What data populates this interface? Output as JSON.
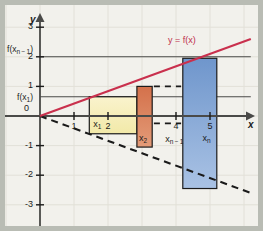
{
  "figure": {
    "background": "#f2f1ec",
    "frame_color": "#b9bcb4"
  },
  "axes": {
    "x_axis_label": "x",
    "y_axis_label": "y",
    "origin_label": "0",
    "x_ticks": [
      {
        "value": 1,
        "label": "1"
      },
      {
        "value": 2,
        "label": "2"
      },
      {
        "value": 4,
        "label": "4"
      },
      {
        "value": 5,
        "label": "5"
      }
    ],
    "y_ticks": [
      {
        "value": 3,
        "label": "3"
      },
      {
        "value": 2,
        "label": "2"
      },
      {
        "value": 1,
        "label": "1"
      },
      {
        "value": -1,
        "label": "-1"
      },
      {
        "value": -2,
        "label": "-2"
      },
      {
        "value": -3,
        "label": "-3"
      }
    ],
    "xlim": [
      -0.2,
      6.2
    ],
    "ylim": [
      -3.5,
      3.6
    ],
    "grid": true,
    "grid_color": "#e2e0d8",
    "axis_color": "#4a4a48"
  },
  "curve": {
    "label": "y = f(x)",
    "color": "#c9304d",
    "from": [
      0,
      0
    ],
    "to": [
      6.2,
      2.6
    ]
  },
  "dashed_line": {
    "color": "#1a1a1a",
    "style": "dashed",
    "from": [
      0,
      0
    ],
    "to": [
      6.2,
      -2.6
    ]
  },
  "value_labels": [
    {
      "name": "f-x-n-minus-1",
      "text": "f(x",
      "sub": "n − 1",
      "tail": ")",
      "y_value": 2.0
    },
    {
      "name": "f-x-1",
      "text": "f(x",
      "sub": "1",
      "tail": ")",
      "y_value": 0.65
    }
  ],
  "guide_lines": [
    {
      "name": "guide-f-xn-1",
      "y_value": 2.0,
      "from_x": 0,
      "to_x": 6.2
    },
    {
      "name": "guide-f-x1",
      "y_value": 0.65,
      "from_x": 0,
      "to_x": 6.2
    }
  ],
  "rectangles": [
    {
      "name": "rect-x1",
      "label": "x",
      "sub": "1",
      "x_start": 1.45,
      "x_end": 2.85,
      "y_top": 0.65,
      "y_bottom": -0.6,
      "fill_top": "#faf3cd",
      "fill_bottom": "#f2e9a8",
      "stroke": "#1b1b1b"
    },
    {
      "name": "rect-x2",
      "label": "x",
      "sub": "2",
      "x_start": 2.85,
      "x_end": 3.3,
      "y_top": 1.0,
      "y_bottom": -1.05,
      "fill_top": "#d4714b",
      "fill_bottom": "#e39b78",
      "stroke": "#1b1b1b"
    },
    {
      "name": "rect-xn",
      "label": "x",
      "sub": "n",
      "x_start": 4.2,
      "x_end": 5.2,
      "y_top": 1.95,
      "y_bottom": -2.45,
      "fill_top": "#6f96cc",
      "fill_bottom": "#a9c2e4",
      "stroke": "#1b1b1b"
    }
  ],
  "ellipsis_dashes": {
    "name": "rect-xn-minus-1-dashes",
    "label": "x",
    "sub": "n − 1",
    "color": "#1b1b1b",
    "x_start": 3.35,
    "x_end": 4.15,
    "y_top": 1.0,
    "y_bottom": -0.25
  },
  "tick_sublabels": [
    {
      "name": "x-1-sublabel",
      "text": "x",
      "sub": "1",
      "x_value": 1.45
    },
    {
      "name": "x-2-sublabel",
      "text": "x",
      "sub": "2",
      "x_value": 2.85
    },
    {
      "name": "x-n-minus-1-sublabel",
      "text": "x",
      "sub": "n − 1",
      "x_value": 3.95
    },
    {
      "name": "x-n-sublabel",
      "text": "x",
      "sub": "n",
      "x_value": 4.9
    }
  ]
}
